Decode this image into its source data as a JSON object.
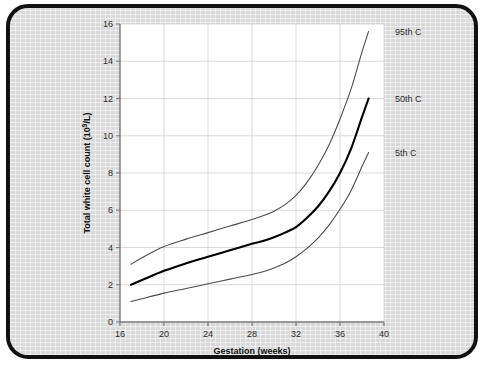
{
  "figure": {
    "background_color": "#d9d9d9",
    "plot_background_color": "#ffffff",
    "border_color": "#111111"
  },
  "chart_data": {
    "type": "line",
    "title": "",
    "subtitle": "",
    "xlabel": "Gestation (weeks)",
    "ylabel": "Total white cell count (10⁹/L)",
    "ylabel_plain": "Total white cell count (",
    "ylabel_exponent": "9",
    "ylabel_tail": "/L)",
    "ylabel_base": "10",
    "xlim": [
      16,
      40
    ],
    "ylim": [
      0,
      16
    ],
    "xticks": [
      16,
      20,
      24,
      28,
      32,
      36,
      40
    ],
    "yticks": [
      0,
      2,
      4,
      6,
      8,
      10,
      12,
      14,
      16
    ],
    "xtick_labels": [
      "16",
      "20",
      "24",
      "28",
      "32",
      "36",
      "40"
    ],
    "ytick_labels": [
      "0",
      "2",
      "4",
      "6",
      "8",
      "10",
      "12",
      "14",
      "16"
    ],
    "grid": true,
    "grid_axis": "both",
    "legend_position": "right-of-axes-inline",
    "x": [
      17,
      18,
      20,
      22,
      24,
      26,
      28,
      29,
      30,
      31,
      32,
      33,
      34,
      35,
      36,
      37,
      38,
      38.6
    ],
    "series": [
      {
        "name": "95th C",
        "label": "95th C",
        "color": "#4a4a4a",
        "linewidth": 1.1,
        "values": [
          3.1,
          3.45,
          4.05,
          4.45,
          4.8,
          5.15,
          5.5,
          5.7,
          5.95,
          6.3,
          6.8,
          7.5,
          8.4,
          9.5,
          10.9,
          12.5,
          14.5,
          15.6
        ]
      },
      {
        "name": "50th C",
        "label": "50th C",
        "color": "#000000",
        "linewidth": 2.1,
        "values": [
          2.0,
          2.25,
          2.75,
          3.15,
          3.5,
          3.85,
          4.2,
          4.35,
          4.55,
          4.8,
          5.1,
          5.6,
          6.2,
          7.0,
          8.0,
          9.3,
          11.0,
          12.0
        ]
      },
      {
        "name": "5th C",
        "label": "5th C",
        "color": "#4a4a4a",
        "linewidth": 1.1,
        "values": [
          1.1,
          1.25,
          1.55,
          1.8,
          2.05,
          2.3,
          2.55,
          2.7,
          2.9,
          3.15,
          3.5,
          3.95,
          4.5,
          5.2,
          6.05,
          7.05,
          8.35,
          9.1
        ]
      }
    ],
    "series_label_values": {
      "95th C": 15.6,
      "50th C": 12.0,
      "5th C": 9.1
    }
  }
}
